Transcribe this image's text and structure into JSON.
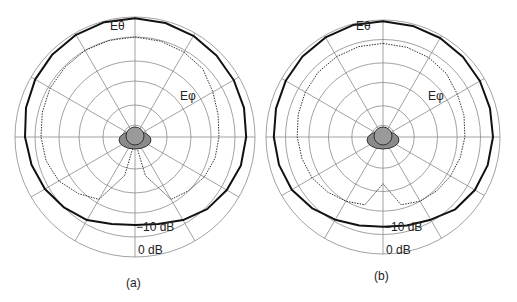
{
  "figure": {
    "panels": [
      {
        "caption": "(a)",
        "curve_labels": {
          "theta": "Eθ",
          "phi": "Eφ"
        },
        "ring_labels": {
          "minus10": "−10 dB",
          "zero": "0 dB"
        }
      },
      {
        "caption": "(b)",
        "curve_labels": {
          "theta": "Eθ",
          "phi": "Eφ"
        },
        "ring_labels": {
          "minus10": "−10 dB",
          "zero": "0 dB"
        }
      }
    ]
  },
  "chart_data": [
    {
      "type": "polar",
      "title": "(a)",
      "radial_unit": "dB",
      "radial_range": [
        -30,
        0
      ],
      "ring_levels_db": [
        -27,
        -22,
        -16,
        -11,
        -5,
        0
      ],
      "ring_labels": [
        "−10 dB",
        "0 dB"
      ],
      "angular_spokes_deg": 30,
      "series": [
        {
          "name": "Eθ",
          "style": "solid",
          "angles_deg": [
            0,
            15,
            30,
            45,
            60,
            75,
            90,
            105,
            120,
            135,
            150,
            165,
            180,
            195,
            210,
            225,
            240,
            255,
            270,
            285,
            300,
            315,
            330,
            345
          ],
          "values_db": [
            -0.3,
            -0.5,
            -0.8,
            -1.2,
            -1.5,
            -1.8,
            -2.2,
            -2.6,
            -3.5,
            -4.5,
            -6,
            -7.5,
            -8,
            -7.5,
            -6,
            -5,
            -4,
            -3.2,
            -2.5,
            -1.8,
            -1.2,
            -0.8,
            -0.5,
            -0.3
          ]
        },
        {
          "name": "Eφ",
          "style": "dotted",
          "angles_deg": [
            0,
            15,
            30,
            45,
            60,
            75,
            90,
            105,
            120,
            135,
            150,
            165,
            180,
            195,
            210,
            225,
            240,
            255,
            270,
            285,
            300,
            315,
            330,
            345
          ],
          "values_db": [
            -5,
            -5.2,
            -5.5,
            -6,
            -7.5,
            -8.5,
            -9,
            -9.3,
            -10,
            -11,
            -12,
            -20,
            -29,
            -20,
            -12,
            -10,
            -8,
            -7,
            -6.5,
            -6,
            -5.5,
            -5.3,
            -5,
            -5
          ]
        }
      ]
    },
    {
      "type": "polar",
      "title": "(b)",
      "radial_unit": "dB",
      "radial_range": [
        -30,
        0
      ],
      "ring_levels_db": [
        -27,
        -22,
        -16,
        -11,
        -5,
        0
      ],
      "ring_labels": [
        "−10 dB",
        "0 dB"
      ],
      "angular_spokes_deg": 30,
      "series": [
        {
          "name": "Eθ",
          "style": "solid",
          "angles_deg": [
            0,
            15,
            30,
            45,
            60,
            75,
            90,
            105,
            120,
            135,
            150,
            165,
            180,
            195,
            210,
            225,
            240,
            255,
            270,
            285,
            300,
            315,
            330,
            345
          ],
          "values_db": [
            -0.3,
            -0.5,
            -0.7,
            -1,
            -1.3,
            -1.6,
            -1.8,
            -2.2,
            -2.8,
            -3.8,
            -5.5,
            -6.5,
            -7,
            -6.5,
            -5.5,
            -4.2,
            -3,
            -2.4,
            -2,
            -1.6,
            -1.2,
            -0.8,
            -0.5,
            -0.3
          ]
        },
        {
          "name": "Eφ",
          "style": "dotted",
          "angles_deg": [
            0,
            15,
            30,
            45,
            60,
            75,
            90,
            105,
            120,
            135,
            150,
            165,
            180,
            195,
            210,
            225,
            240,
            255,
            270,
            285,
            300,
            315,
            330,
            345
          ],
          "values_db": [
            -6,
            -6.2,
            -6.5,
            -7,
            -8,
            -8.5,
            -9,
            -9.5,
            -10,
            -10.5,
            -11,
            -12,
            -18,
            -12,
            -11,
            -10,
            -9,
            -8.5,
            -8,
            -7.5,
            -7,
            -6.5,
            -6.2,
            -6
          ]
        }
      ]
    }
  ]
}
